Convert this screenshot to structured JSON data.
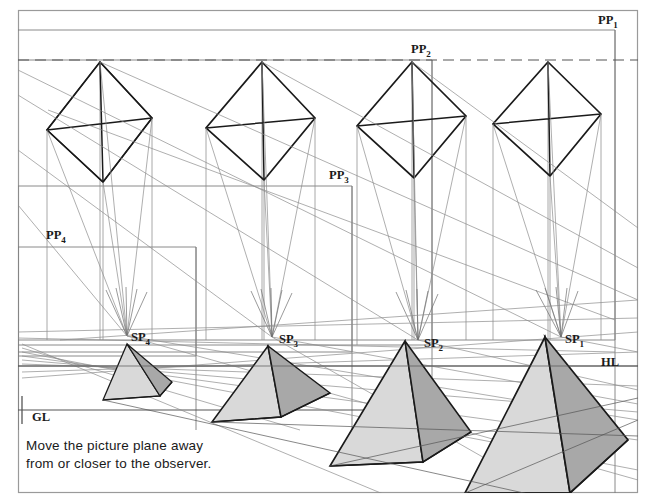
{
  "figure": {
    "caption_lines": [
      "Move the picture plane away",
      "from or closer to the observer."
    ],
    "colors": {
      "background": "#ffffff",
      "border": "#9a9a9a",
      "construction_line": "#8c8c8c",
      "object_line": "#1a1a1a",
      "face_light": "#d9d9d9",
      "face_dark": "#a8a8a8",
      "text": "#1a1a1a"
    },
    "labels": [
      {
        "id": "pp1",
        "text": "PP",
        "sub": "1",
        "x": 600,
        "y": 22
      },
      {
        "id": "pp2",
        "text": "PP",
        "sub": "2",
        "x": 419,
        "y": 51
      },
      {
        "id": "pp3",
        "text": "PP",
        "sub": "3",
        "x": 337,
        "y": 177
      },
      {
        "id": "pp4",
        "text": "PP",
        "sub": "4",
        "x": 54,
        "y": 237
      },
      {
        "id": "sp4",
        "text": "SP",
        "sub": "4",
        "x": 139,
        "y": 339
      },
      {
        "id": "sp3",
        "text": "SP",
        "sub": "3",
        "x": 287,
        "y": 341
      },
      {
        "id": "sp2",
        "text": "SP",
        "sub": "2",
        "x": 432,
        "y": 345
      },
      {
        "id": "sp1",
        "text": "SP",
        "sub": "1",
        "x": 573,
        "y": 341
      },
      {
        "id": "hl",
        "text": "HL",
        "sub": "",
        "x": 610,
        "y": 364
      },
      {
        "id": "gl",
        "text": "GL",
        "sub": "",
        "x": 39,
        "y": 419
      }
    ],
    "horizon_line": {
      "label": "HL",
      "y": 366
    },
    "ground_line": {
      "label": "GL",
      "y": 410
    },
    "station_points": [
      {
        "name": "SP1",
        "x": 561,
        "y": 337
      },
      {
        "name": "SP2",
        "x": 418,
        "y": 340
      },
      {
        "name": "SP3",
        "x": 272,
        "y": 337
      },
      {
        "name": "SP4",
        "x": 127,
        "y": 336
      }
    ],
    "picture_planes": [
      {
        "name": "PP1",
        "x": 615,
        "y": 30,
        "width": 0,
        "note": "outermost frame, top right"
      },
      {
        "name": "PP2",
        "x": 432,
        "y": 60,
        "note": "second plane"
      },
      {
        "name": "PP3",
        "x": 352,
        "y": 186,
        "note": "third plane"
      },
      {
        "name": "PP4",
        "x": 68,
        "y": 247,
        "note": "nearest plane"
      }
    ],
    "plan_objects": [
      {
        "name": "octahedron-plan-4",
        "cx": 100,
        "cy": 115
      },
      {
        "name": "octahedron-plan-3",
        "cx": 262,
        "cy": 115
      },
      {
        "name": "octahedron-plan-2",
        "cx": 412,
        "cy": 113
      },
      {
        "name": "octahedron-plan-1",
        "cx": 548,
        "cy": 112
      }
    ],
    "pyramids": [
      {
        "name": "pyramid-4",
        "apex_x": 127,
        "base_y": 400,
        "half_width": 33,
        "note": "smallest, nearest picture plane"
      },
      {
        "name": "pyramid-3",
        "apex_x": 268,
        "base_y": 422,
        "half_width": 56,
        "note": "small"
      },
      {
        "name": "pyramid-2",
        "apex_x": 405,
        "base_y": 466,
        "half_width": 93,
        "note": "large"
      },
      {
        "name": "pyramid-1",
        "apex_x": 545,
        "base_y": 495,
        "half_width": 120,
        "note": "largest, farthest picture plane"
      }
    ]
  }
}
